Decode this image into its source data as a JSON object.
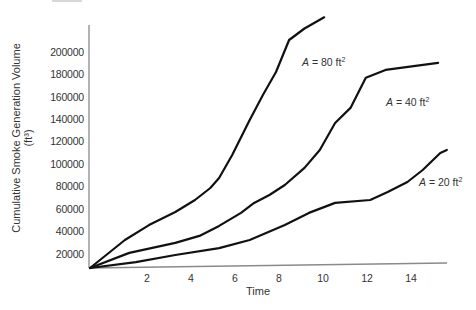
{
  "chart_data": {
    "type": "line",
    "title": "",
    "xlabel": "Time",
    "ylabel": "Cumulative Smoke Generation Volume",
    "ylabel_unit": "(ft³)",
    "x_ticks": [
      "2",
      "4",
      "6",
      "8",
      "10",
      "12",
      "14"
    ],
    "y_ticks": [
      "200000",
      "180000",
      "160000",
      "140000",
      "120000",
      "100000",
      "80000",
      "60000",
      "40000",
      "20000"
    ],
    "xlim": [
      0,
      16
    ],
    "ylim": [
      7500,
      215000
    ],
    "grid": false,
    "legend": "inline labels",
    "series": [
      {
        "name": "A = 80 ft²",
        "label_prefix": "A",
        "label_value": " = 80 ft",
        "x": [
          0,
          1.0,
          2.1,
          3.3,
          4.2,
          4.9,
          5.3,
          5.9,
          6.7,
          7.3,
          7.9,
          8.5,
          9.2,
          10.1
        ],
        "y": [
          7500,
          32500,
          45800,
          57400,
          68100,
          78800,
          87700,
          108200,
          139400,
          161700,
          182200,
          210700,
          221000,
          231000
        ]
      },
      {
        "name": "A = 40 ft²",
        "label_prefix": "A",
        "label_value": " = 40 ft",
        "x": [
          0,
          1.2,
          3.3,
          4.4,
          5.3,
          6.3,
          6.9,
          7.6,
          8.3,
          9.2,
          9.9,
          10.6,
          11.3,
          12.0,
          12.9,
          15.3
        ],
        "y": [
          7500,
          21000,
          29900,
          36100,
          45000,
          56600,
          65500,
          72600,
          81500,
          96700,
          112700,
          136800,
          150200,
          177000,
          184100,
          190300
        ]
      },
      {
        "name": "A = 20 ft²",
        "label_prefix": "A",
        "label_value": " = 20 ft",
        "x": [
          0,
          1.5,
          3.3,
          5.3,
          6.7,
          8.3,
          9.4,
          10.6,
          12.2,
          13.0,
          13.9,
          14.6,
          15.4,
          15.7
        ],
        "y": [
          7500,
          12800,
          19100,
          25300,
          32500,
          45800,
          56600,
          65500,
          68100,
          75300,
          84200,
          94900,
          110000,
          112700
        ]
      }
    ]
  },
  "labels": {
    "a80": {
      "var": "A",
      "text": " = 80 ft",
      "sup": "2"
    },
    "a40": {
      "var": "A",
      "text": " = 40 ft",
      "sup": "2"
    },
    "a20": {
      "var": "A",
      "text": " = 20 ft",
      "sup": "2"
    }
  },
  "colors": {
    "curve": "#111111",
    "axis": "#888888",
    "text": "#333333"
  }
}
